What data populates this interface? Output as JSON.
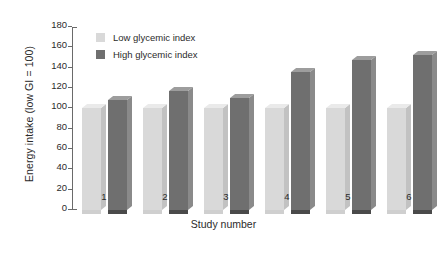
{
  "chart_data": {
    "type": "bar",
    "title": "",
    "subtitle": "",
    "xlabel": "Study number",
    "ylabel": "Energy intake (low GI = 100)",
    "categories": [
      "1",
      "2",
      "3",
      "4",
      "5",
      "6"
    ],
    "series": [
      {
        "name": "Low glycemic index",
        "color": "#d9d9d9",
        "values": [
          100,
          100,
          100,
          100,
          100,
          100
        ]
      },
      {
        "name": "High glycemic index",
        "color": "#6f6f6f",
        "values": [
          108,
          117,
          110,
          136,
          148,
          152
        ]
      }
    ],
    "ylim": [
      0,
      180
    ],
    "yticks": [
      0,
      20,
      40,
      60,
      80,
      100,
      120,
      140,
      160,
      180
    ],
    "ytick_labels": [
      "0",
      "20",
      "40",
      "60",
      "80",
      "100",
      "120",
      "140",
      "160",
      "180"
    ],
    "grid": false,
    "legend_position": "upper-left-inside",
    "style": "3d-bar",
    "background": "#ffffff"
  }
}
